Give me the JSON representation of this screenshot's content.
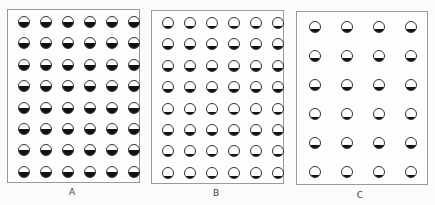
{
  "figure": {
    "panels": [
      {
        "label": "A",
        "rows": 8,
        "cols": 6,
        "fill_fraction": 0.5,
        "description": "dense grid, half-filled circles"
      },
      {
        "label": "B",
        "rows": 8,
        "cols": 6,
        "fill_fraction": 0.25,
        "description": "dense grid, quarter-filled circles"
      },
      {
        "label": "C",
        "rows": 6,
        "cols": 4,
        "fill_fraction": 0.25,
        "description": "sparse grid, quarter-filled circles"
      }
    ],
    "colors": {
      "border": "#9a9a9a",
      "fill": "#111111",
      "background": "#fbfbfb"
    }
  }
}
